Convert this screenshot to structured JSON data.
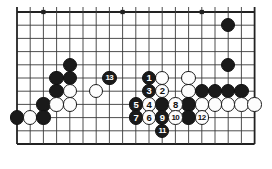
{
  "diagram": {
    "kind": "go-board-diagram",
    "title": "",
    "board": {
      "columns": 19,
      "visible_rows": 11,
      "origin_x": 17,
      "origin_y": 12,
      "spacing": 13.2,
      "line_color": "#3a3a3a",
      "edge_color": "#222222",
      "background": "#ffffff",
      "star_points": [
        {
          "col": 3,
          "row": 1
        },
        {
          "col": 9,
          "row": 1
        },
        {
          "col": 15,
          "row": 1
        }
      ]
    },
    "colors": {
      "black": "#1a1a1a",
      "white": "#fdfdfd",
      "stone_outline": "#1c1c1c",
      "black_label": "#ffffff",
      "white_label": "#111111"
    },
    "stones": [
      {
        "col": 17,
        "row": 2,
        "color": "black",
        "label": ""
      },
      {
        "col": 5,
        "row": 5,
        "color": "black",
        "label": ""
      },
      {
        "col": 17,
        "row": 5,
        "color": "black",
        "label": ""
      },
      {
        "col": 5,
        "row": 6,
        "color": "black",
        "label": ""
      },
      {
        "col": 4,
        "row": 6,
        "color": "black",
        "label": ""
      },
      {
        "col": 4,
        "row": 7,
        "color": "black",
        "label": ""
      },
      {
        "col": 5,
        "row": 7,
        "color": "white",
        "label": ""
      },
      {
        "col": 7,
        "row": 7,
        "color": "white",
        "label": ""
      },
      {
        "col": 3,
        "row": 8,
        "color": "black",
        "label": ""
      },
      {
        "col": 4,
        "row": 8,
        "color": "white",
        "label": ""
      },
      {
        "col": 5,
        "row": 8,
        "color": "white",
        "label": ""
      },
      {
        "col": 1,
        "row": 9,
        "color": "black",
        "label": ""
      },
      {
        "col": 2,
        "row": 9,
        "color": "white",
        "label": ""
      },
      {
        "col": 3,
        "row": 9,
        "color": "black",
        "label": ""
      },
      {
        "col": 8,
        "row": 6,
        "color": "black",
        "label": "13"
      },
      {
        "col": 11,
        "row": 6,
        "color": "black",
        "label": "1"
      },
      {
        "col": 12,
        "row": 6,
        "color": "white",
        "label": ""
      },
      {
        "col": 14,
        "row": 6,
        "color": "white",
        "label": ""
      },
      {
        "col": 11,
        "row": 7,
        "color": "black",
        "label": "3"
      },
      {
        "col": 12,
        "row": 7,
        "color": "white",
        "label": "2"
      },
      {
        "col": 14,
        "row": 7,
        "color": "white",
        "label": ""
      },
      {
        "col": 15,
        "row": 7,
        "color": "black",
        "label": ""
      },
      {
        "col": 16,
        "row": 7,
        "color": "black",
        "label": ""
      },
      {
        "col": 17,
        "row": 7,
        "color": "black",
        "label": ""
      },
      {
        "col": 18,
        "row": 7,
        "color": "black",
        "label": ""
      },
      {
        "col": 10,
        "row": 8,
        "color": "black",
        "label": "5"
      },
      {
        "col": 11,
        "row": 8,
        "color": "white",
        "label": "4"
      },
      {
        "col": 12,
        "row": 8,
        "color": "black",
        "label": ""
      },
      {
        "col": 13,
        "row": 8,
        "color": "white",
        "label": "8"
      },
      {
        "col": 14,
        "row": 8,
        "color": "black",
        "label": ""
      },
      {
        "col": 15,
        "row": 8,
        "color": "white",
        "label": ""
      },
      {
        "col": 16,
        "row": 8,
        "color": "white",
        "label": ""
      },
      {
        "col": 17,
        "row": 8,
        "color": "white",
        "label": ""
      },
      {
        "col": 18,
        "row": 8,
        "color": "white",
        "label": ""
      },
      {
        "col": 19,
        "row": 8,
        "color": "white",
        "label": ""
      },
      {
        "col": 10,
        "row": 9,
        "color": "black",
        "label": "7"
      },
      {
        "col": 11,
        "row": 9,
        "color": "white",
        "label": "6"
      },
      {
        "col": 12,
        "row": 9,
        "color": "black",
        "label": "9"
      },
      {
        "col": 13,
        "row": 9,
        "color": "white",
        "label": "10"
      },
      {
        "col": 14,
        "row": 9,
        "color": "black",
        "label": ""
      },
      {
        "col": 15,
        "row": 9,
        "color": "white",
        "label": "12"
      },
      {
        "col": 12,
        "row": 10,
        "color": "black",
        "label": "11"
      }
    ],
    "move_sequence": [
      "1",
      "2",
      "3",
      "4",
      "5",
      "6",
      "7",
      "8",
      "9",
      "10",
      "11",
      "12",
      "13"
    ]
  }
}
